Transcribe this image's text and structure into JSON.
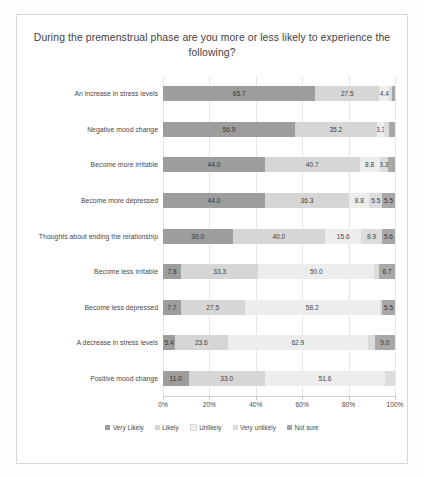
{
  "chart_data": {
    "type": "bar",
    "orientation": "horizontal",
    "stacked": true,
    "stack_mode": "percent",
    "title": "During the premenstrual phase are you more or less likely to experience the following?",
    "xlabel": "",
    "ylabel": "",
    "xlim": [
      0,
      100
    ],
    "xticks": [
      "0%",
      "20%",
      "40%",
      "60%",
      "80%",
      "100%"
    ],
    "xtick_values": [
      0,
      20,
      40,
      60,
      80,
      100
    ],
    "grid": true,
    "legend_position": "bottom",
    "legend": [
      "Very Likely",
      "Likely",
      "Unlikely",
      "Very unlikely",
      "Not sure"
    ],
    "categories": [
      "An increase in stress levels",
      "Negative mood change",
      "Become more irritable",
      "Become more depressed",
      "Thoughts about ending the relationship",
      "Become less irritable",
      "Become less depressed",
      "A decrease in stress levels",
      "Positive mood change"
    ],
    "series": [
      {
        "name": "Very Likely",
        "values": [
          65.7,
          56.9,
          44.0,
          44.0,
          30.0,
          7.8,
          7.7,
          5.4,
          11.0
        ]
      },
      {
        "name": "Likely",
        "values": [
          27.5,
          35.2,
          40.7,
          36.3,
          40.0,
          33.3,
          27.5,
          23.6,
          33.0
        ]
      },
      {
        "name": "Unlikely",
        "values": [
          4.4,
          3.3,
          8.8,
          8.8,
          15.6,
          50.0,
          58.2,
          62.9,
          51.6
        ]
      },
      {
        "name": "Very unlikely",
        "values": [
          1.1,
          2.2,
          3.3,
          5.5,
          8.9,
          2.2,
          1.1,
          3.1,
          4.4
        ]
      },
      {
        "name": "Not sure",
        "values": [
          1.3,
          2.4,
          3.2,
          5.5,
          5.6,
          6.7,
          5.5,
          9.0,
          0.0
        ]
      }
    ],
    "bar_labels": [
      [
        "65.7",
        "27.5",
        "4.4",
        "",
        ""
      ],
      [
        "56.9",
        "35.2",
        "3.3",
        "",
        ""
      ],
      [
        "44.0",
        "40.7",
        "8.8",
        "3.3",
        ""
      ],
      [
        "44.0",
        "36.3",
        "8.8",
        "5.5",
        "5.5"
      ],
      [
        "30.0",
        "40.0",
        "15.6",
        "8.9",
        "5.6"
      ],
      [
        "7.8",
        "33.3",
        "50.0",
        "",
        "6.7"
      ],
      [
        "7.7",
        "27.5",
        "58.2",
        "",
        "5.5"
      ],
      [
        "5.4",
        "23.6",
        "62.9",
        "",
        "9.0"
      ],
      [
        "11.0",
        "33.0",
        "51.6",
        "",
        "4.4"
      ]
    ]
  }
}
